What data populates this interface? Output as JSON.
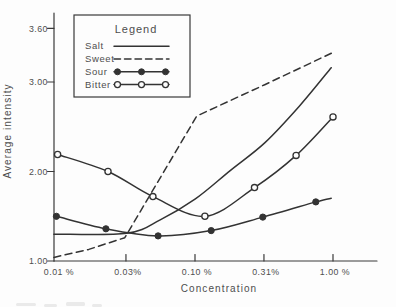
{
  "window": {
    "width": 396,
    "height": 307,
    "background": "#fdfdfd"
  },
  "colors": {
    "ink": "#3a3a3a",
    "curve": "#333333",
    "text": "#4e4e4e",
    "paper": "#fdfdfd"
  },
  "axes": {
    "y_title": "Average intensity",
    "x_title": "Concentration",
    "y_ticks": [
      {
        "label": "3.60",
        "value": 3.6
      },
      {
        "label": "3.00",
        "value": 3.0
      },
      {
        "label": "2.00",
        "value": 2.0
      },
      {
        "label": "1.00",
        "value": 1.0
      }
    ],
    "x_ticks": [
      {
        "label": "0.01 %",
        "value": 0.01
      },
      {
        "label": "0.03%",
        "value": 0.0316
      },
      {
        "label": "0.10 %",
        "value": 0.1
      },
      {
        "label": "0.31%",
        "value": 0.316
      },
      {
        "label": "1.00 %",
        "value": 1.0
      }
    ]
  },
  "legend": {
    "title": "Legend",
    "items": [
      {
        "label": "Salt",
        "line": "solid",
        "marker": "none"
      },
      {
        "label": "Sweet",
        "line": "dashed",
        "marker": "none"
      },
      {
        "label": "Sour",
        "line": "solid",
        "marker": "filled-circle"
      },
      {
        "label": "Bitter",
        "line": "solid",
        "marker": "open-circle"
      }
    ]
  },
  "chart_data": {
    "type": "line",
    "title": "",
    "xlabel": "Concentration",
    "ylabel": "Average intensity",
    "x_scale": "log",
    "x_unit": "%",
    "xlim": [
      0.01,
      1.0
    ],
    "ylim": [
      1.0,
      3.6
    ],
    "grid": false,
    "legend_position": "top-left-inside",
    "series": [
      {
        "name": "Salt",
        "line": "solid",
        "marker": "none",
        "smooth": true,
        "x": [
          0.0095,
          0.032,
          0.056,
          0.1,
          0.18,
          0.32,
          0.57,
          0.97
        ],
        "y": [
          1.3,
          1.31,
          1.46,
          1.69,
          2.01,
          2.32,
          2.73,
          3.16
        ]
      },
      {
        "name": "Sweet",
        "line": "dashed",
        "marker": "none",
        "smooth": false,
        "x": [
          0.0095,
          0.017,
          0.031,
          0.103,
          0.32,
          1.03
        ],
        "y": [
          1.04,
          1.13,
          1.26,
          2.62,
          2.97,
          3.34
        ]
      },
      {
        "name": "Sour",
        "line": "solid",
        "marker": "filled-circle",
        "smooth": true,
        "marker_omit_last": true,
        "x": [
          0.0099,
          0.0226,
          0.054,
          0.131,
          0.31,
          0.75,
          0.97
        ],
        "y": [
          1.5,
          1.36,
          1.28,
          1.34,
          1.49,
          1.66,
          1.7
        ]
      },
      {
        "name": "Bitter",
        "line": "solid",
        "marker": "open-circle",
        "smooth": true,
        "x": [
          0.0101,
          0.0234,
          0.0495,
          0.118,
          0.27,
          0.54,
          1.0
        ],
        "y": [
          2.19,
          2.0,
          1.72,
          1.5,
          1.82,
          2.18,
          2.61
        ]
      }
    ]
  }
}
